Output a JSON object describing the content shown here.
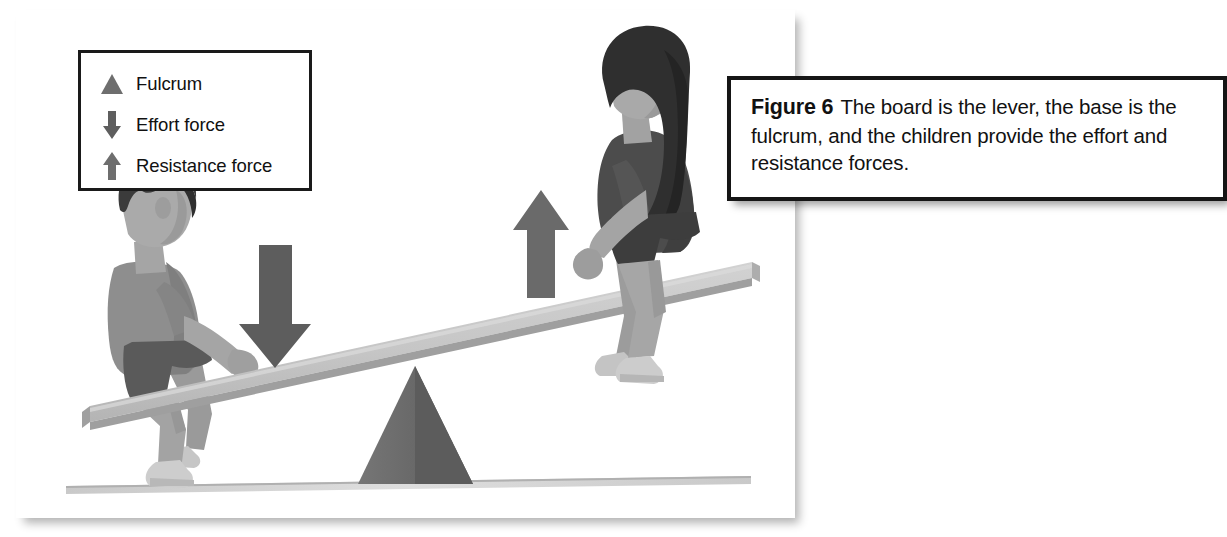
{
  "figure": {
    "panel_name": "lever-seesaw-illustration",
    "background_color": "#ffffff",
    "ground_line_color": "#d9d9d9"
  },
  "legend": {
    "border_color": "#1a1a1a",
    "items": [
      {
        "icon": "triangle-up-icon",
        "label": "Fulcrum",
        "color": "#6e6e6e"
      },
      {
        "icon": "arrow-down-icon",
        "label": "Effort force",
        "color": "#5e5e5e"
      },
      {
        "icon": "arrow-up-icon",
        "label": "Resistance force",
        "color": "#6e6e6e"
      }
    ]
  },
  "caption": {
    "figure_label": "Figure 6",
    "text": "The board is the lever, the base is the fulcrum, and the children provide the effort and resistance forces.",
    "border_color": "#151515"
  },
  "illustration": {
    "lever_board": {
      "name": "lever-board",
      "color": "#c4c4c4",
      "edge_color": "#a8a8a8"
    },
    "fulcrum": {
      "name": "fulcrum-triangle",
      "color": "#6a6a6a"
    },
    "effort_arrow": {
      "name": "effort-force-arrow",
      "direction": "down",
      "color": "#5d5d5d"
    },
    "resistance_arrow": {
      "name": "resistance-force-arrow",
      "direction": "up",
      "color": "#6b6b6b"
    },
    "child_left": {
      "name": "child-boy-figure",
      "hair_color": "#3a3a3a",
      "skin_color": "#a9a9a9",
      "shirt_color": "#8c8c8c",
      "shorts_color": "#545454",
      "shoe_color": "#cfcfcf"
    },
    "child_right": {
      "name": "child-girl-figure",
      "hair_color": "#2f2f2f",
      "skin_color": "#a9a9a9",
      "shirt_color": "#4a4a4a",
      "shorts_color": "#3d3d3d",
      "shoe_color": "#cfcfcf"
    }
  }
}
